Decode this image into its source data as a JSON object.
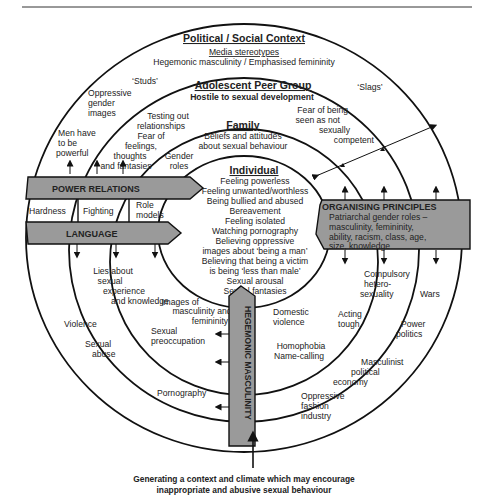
{
  "diagram": {
    "political": {
      "title": "Political / Social Context",
      "subtitle": "Media stereotypes",
      "line": "Hegemonic masculinity / Emphasised femininity"
    },
    "peer": {
      "title": "Adolescent Peer Group",
      "subtitle": "Hostile to sexual development"
    },
    "family": {
      "title": "Family",
      "line1": "Beliefs and attitudes",
      "line2": "about sexual behaviour"
    },
    "individual": {
      "title": "Individual",
      "items": [
        "Feeling powerless",
        "Feeling unwanted/worthless",
        "Being bullied and abused",
        "Bereavement",
        "Feeling isolated",
        "Watching pornography",
        "Believing oppressive",
        "images about ‘being a man’",
        "Believing that being a victim",
        "is being ‘less than male’",
        "Sexual arousal",
        "Sexual fantasies"
      ]
    },
    "labels": {
      "studs": "‘Studs’",
      "slags": "‘Slags’",
      "oppressive_gender_images": [
        "Oppressive",
        "gender",
        "images"
      ],
      "men_powerful": [
        "Men have",
        "to be",
        "powerful"
      ],
      "testing_out": [
        "Testing out",
        "relationships"
      ],
      "fear_feelings": [
        "Fear of",
        "feelings,",
        "thoughts",
        "and fantasies"
      ],
      "gender_roles": [
        "Gender",
        "roles"
      ],
      "fear_competent": [
        "Fear of being",
        "seen as not",
        "sexually",
        "competent"
      ],
      "hardness": "Hardness",
      "fighting": "Fighting",
      "role_models": [
        "Role",
        "models"
      ],
      "lies": [
        "Lies about",
        "sexual",
        "experience",
        "and knowledge"
      ],
      "images_masc": [
        "Images of",
        "masculinity and",
        "femininity"
      ],
      "violence": "Violence",
      "sexual_abuse": [
        "Sexual",
        "abuse"
      ],
      "sexual_preoccupation": [
        "Sexual",
        "preoccupation"
      ],
      "pornography": "Pornography",
      "domestic_violence": [
        "Domestic",
        "violence"
      ],
      "homophobia": [
        "Homophobia",
        "Name-calling"
      ],
      "oppressive_fashion": [
        "Oppressive",
        "fashion",
        "industry"
      ],
      "acting_tough": [
        "Acting",
        "tough"
      ],
      "masculinist": [
        "Masculinist",
        "political",
        "economy"
      ],
      "compulsory": [
        "Compulsory",
        "hetero-",
        "sexuality"
      ],
      "wars": "Wars",
      "power_politics": [
        "Power",
        "politics"
      ]
    },
    "bands": {
      "power_relations": "POWER RELATIONS",
      "language": "LANGUAGE",
      "organising_title": "ORGANISING PRINCIPLES",
      "organising_lines": [
        "Patriarchal gender roles –",
        "masculinity, femininity,",
        "ability, racism, class, age,",
        "size, knowledge"
      ],
      "hegemonic": "HEGEMONIC MASCULINITY"
    },
    "caption": [
      "Generating a context and climate which may encourage",
      "inappropriate and abusive sexual behaviour"
    ]
  },
  "colors": {
    "band_fill": "#9a9a9a",
    "stroke": "#111111",
    "text": "#222222"
  }
}
